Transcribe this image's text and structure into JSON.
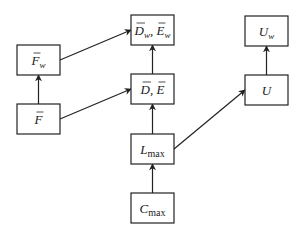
{
  "diagram": {
    "nodes": [
      {
        "id": "Fw",
        "base": "F",
        "bar": true,
        "sub": "w",
        "sub_italic": true
      },
      {
        "id": "F",
        "base": "F",
        "bar": true,
        "sub": "",
        "sub_italic": true
      },
      {
        "id": "DwEw",
        "base": "D",
        "bar": true,
        "sub": "w",
        "sub_italic": true,
        "sep": ", ",
        "base2": "E",
        "bar2": true,
        "sub2": "w"
      },
      {
        "id": "DE",
        "base": "D",
        "bar": true,
        "sub": "",
        "sub_italic": true,
        "sep": ", ",
        "base2": "E",
        "bar2": true,
        "sub2": ""
      },
      {
        "id": "Uw",
        "base": "U",
        "bar": false,
        "sub": "w",
        "sub_italic": true
      },
      {
        "id": "U",
        "base": "U",
        "bar": false,
        "sub": "",
        "sub_italic": true
      },
      {
        "id": "Lmax",
        "base": "L",
        "bar": false,
        "sub": "max",
        "sub_italic": false
      },
      {
        "id": "Cmax",
        "base": "C",
        "bar": false,
        "sub": "max",
        "sub_italic": false
      }
    ],
    "edges": [
      {
        "from": "F",
        "to": "Fw"
      },
      {
        "from": "Fw",
        "to": "DwEw"
      },
      {
        "from": "F",
        "to": "DE"
      },
      {
        "from": "DE",
        "to": "DwEw"
      },
      {
        "from": "Lmax",
        "to": "DE"
      },
      {
        "from": "Lmax",
        "to": "U"
      },
      {
        "from": "U",
        "to": "Uw"
      },
      {
        "from": "Cmax",
        "to": "Lmax"
      }
    ]
  }
}
